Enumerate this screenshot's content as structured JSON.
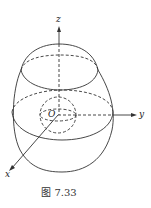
{
  "figure": {
    "caption": "图 7.33",
    "labels": {
      "z": "z",
      "y": "y",
      "x": "x",
      "origin": "O"
    }
  }
}
